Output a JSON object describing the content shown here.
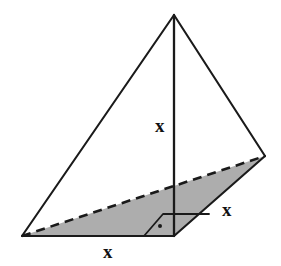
{
  "figure": {
    "kind": "geometry-diagram",
    "canvas": {
      "width": 281,
      "height": 266
    },
    "colors": {
      "background": "#ffffff",
      "stroke": "#1a1a1a",
      "base_fill": "#adadad",
      "label_text": "#111111"
    },
    "vertices": {
      "apex": {
        "name": "apex",
        "x": 174,
        "y": 15
      },
      "base_left": {
        "name": "base-left",
        "x": 22,
        "y": 236
      },
      "base_front": {
        "name": "base-front",
        "x": 174,
        "y": 236
      },
      "base_right": {
        "name": "base-right",
        "x": 265,
        "y": 156
      }
    },
    "edges": [
      {
        "name": "apex-to-base-left",
        "style": "solid",
        "from": "apex",
        "to": "base_left"
      },
      {
        "name": "apex-to-base-right",
        "style": "solid",
        "from": "apex",
        "to": "base_right"
      },
      {
        "name": "base-left-to-base-front",
        "style": "solid",
        "from": "base_left",
        "to": "base_front"
      },
      {
        "name": "base-front-to-base-right",
        "style": "solid",
        "from": "base_front",
        "to": "base_right"
      },
      {
        "name": "base-left-to-base-right-hidden",
        "style": "dashed",
        "from": "base_left",
        "to": "base_right"
      },
      {
        "name": "altitude",
        "style": "solid",
        "from": "apex",
        "to": "base_front"
      }
    ],
    "shaded_region": {
      "name": "base-triangle",
      "fill": "#adadad",
      "points": "22,236 265,156 174,236"
    },
    "right_angle_marker": {
      "name": "right-angle-marker",
      "at_vertex": "base_front",
      "outline_points": "144,236 163,214 174,214",
      "extension": {
        "x1": 174,
        "y1": 214,
        "x2": 209,
        "y2": 214
      },
      "dot": {
        "cx": 160,
        "cy": 226,
        "r": 2.0
      }
    },
    "labels": [
      {
        "name": "altitude-length-label",
        "text": "x",
        "x": 155,
        "y": 116,
        "describes": "height of pyramid"
      },
      {
        "name": "slant-base-edge-label",
        "text": "x",
        "x": 222,
        "y": 200,
        "describes": "base edge from front vertex to right vertex"
      },
      {
        "name": "front-base-edge-label",
        "text": "x",
        "x": 103,
        "y": 242,
        "describes": "base edge from left vertex to front vertex"
      }
    ]
  }
}
